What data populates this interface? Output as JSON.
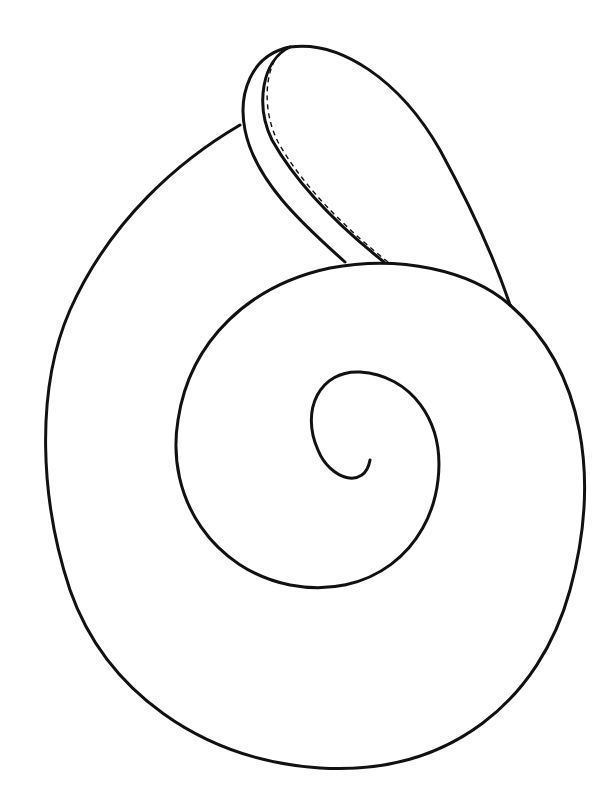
{
  "image": {
    "subject": "snail shell line drawing",
    "style": "black outline on white",
    "colors": {
      "background": "#ffffff",
      "line": "#111111"
    }
  }
}
